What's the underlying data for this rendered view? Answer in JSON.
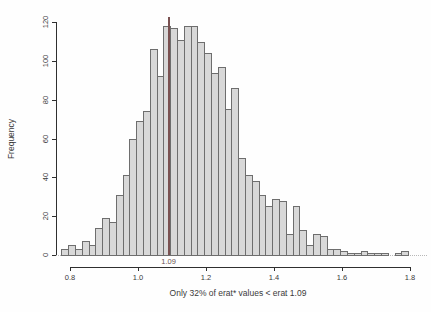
{
  "figure": {
    "background": "#fefefe"
  },
  "chart_data": {
    "type": "bar",
    "subtype": "histogram",
    "title": "",
    "xlabel": "Only 32% of erat* values < erat 1.09",
    "ylabel": "Frequency",
    "bin_start": 0.775,
    "bin_width": 0.02,
    "counts": [
      3,
      5,
      3,
      7,
      5,
      14,
      19,
      17,
      31,
      41,
      60,
      69,
      74,
      106,
      92,
      118,
      117,
      111,
      118,
      118,
      110,
      104,
      94,
      97,
      75,
      86,
      50,
      41,
      38,
      31,
      25,
      29,
      28,
      11,
      25,
      13,
      5,
      11,
      10,
      3,
      3,
      2,
      1,
      1,
      2,
      1,
      1,
      1,
      0,
      1,
      2
    ],
    "xtick_values": [
      0.8,
      1.0,
      1.2,
      1.4,
      1.6,
      1.8
    ],
    "xtick_labels": [
      "0.8",
      "1.0",
      "1.2",
      "1.4",
      "1.6",
      "1.8"
    ],
    "ytick_values": [
      0,
      20,
      40,
      60,
      80,
      100,
      120
    ],
    "ytick_labels": [
      "0",
      "20",
      "40",
      "60",
      "80",
      "100",
      "120"
    ],
    "xlim": [
      0.759,
      1.85
    ],
    "ylim": [
      -6.2,
      124.7
    ],
    "axis_x_range": [
      0.8,
      1.8
    ],
    "axis_y_range": [
      0,
      120
    ],
    "grid": false,
    "legend": null,
    "bar_fill": "#d8d8d8",
    "bar_border": "#6e6e6e",
    "zero_line": {
      "y": 0,
      "style": "dotted",
      "color": "#b8b8b8"
    },
    "marker": {
      "value": 1.09,
      "label": "1.09",
      "color": "#7a5151",
      "top_count": 122.5
    }
  }
}
